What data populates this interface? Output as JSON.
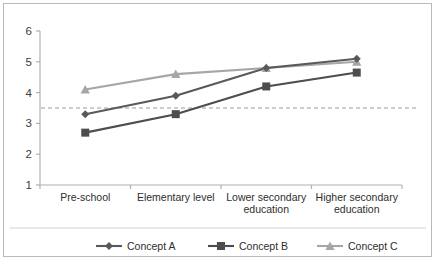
{
  "chart_data": {
    "type": "line",
    "title": "",
    "xlabel": "",
    "ylabel": "",
    "ylim": [
      1,
      6
    ],
    "yticks": [
      1,
      2,
      3,
      4,
      5,
      6
    ],
    "grid": false,
    "legend_position": "bottom",
    "categories": [
      "Pre-school",
      "Elementary level",
      "Lower secondary education",
      "Higher secondary education"
    ],
    "series": [
      {
        "name": "Concept A",
        "marker": "diamond",
        "color": "#595959",
        "values": [
          3.3,
          3.9,
          4.8,
          5.1
        ]
      },
      {
        "name": "Concept B",
        "marker": "square",
        "color": "#4d4d4d",
        "values": [
          2.7,
          3.3,
          4.2,
          4.65
        ]
      },
      {
        "name": "Concept C",
        "marker": "triangle",
        "color": "#a6a6a6",
        "values": [
          4.1,
          4.6,
          4.8,
          5.0
        ]
      }
    ],
    "annotations": [
      {
        "type": "reference-line",
        "orientation": "horizontal",
        "value": 3.5,
        "style": "dashed",
        "color": "#9a9a9a"
      }
    ]
  },
  "axis": {
    "y_tick_labels": [
      "6",
      "5",
      "4",
      "3",
      "2",
      "1"
    ]
  },
  "legend": {
    "items": [
      {
        "label": "Concept A"
      },
      {
        "label": "Concept B"
      },
      {
        "label": "Concept C"
      }
    ]
  },
  "categories_wrapped": [
    [
      "Pre-school"
    ],
    [
      "Elementary level"
    ],
    [
      "Lower secondary",
      "education"
    ],
    [
      "Higher secondary",
      "education"
    ]
  ]
}
